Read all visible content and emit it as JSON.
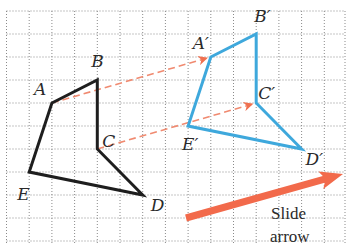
{
  "grid": {
    "x0": 6.5,
    "y0": 11,
    "step_x": 22.7,
    "step_y": 23,
    "cols": 15,
    "rows": 10,
    "color": "#8a8a8a"
  },
  "original": {
    "color": "#1e1e1e",
    "vertices": [
      {
        "label": "A",
        "i": 2,
        "j": 4,
        "lx": -18,
        "ly": -8
      },
      {
        "label": "B",
        "i": 4,
        "j": 3,
        "lx": -6,
        "ly": -13
      },
      {
        "label": "C",
        "i": 4,
        "j": 6,
        "lx": 5,
        "ly": -2
      },
      {
        "label": "D",
        "i": 6,
        "j": 8,
        "lx": 8,
        "ly": 16
      },
      {
        "label": "E",
        "i": 1,
        "j": 7,
        "lx": -12,
        "ly": 28
      }
    ]
  },
  "image": {
    "color": "#3ea8dc",
    "vertices": [
      {
        "label": "A′",
        "i": 9,
        "j": 2,
        "lx": -18,
        "ly": -8
      },
      {
        "label": "B′",
        "i": 11,
        "j": 1,
        "lx": -2,
        "ly": -12
      },
      {
        "label": "C′",
        "i": 11,
        "j": 4,
        "lx": 2,
        "ly": -4
      },
      {
        "label": "D′",
        "i": 13,
        "j": 6,
        "lx": 4,
        "ly": 16
      },
      {
        "label": "E′",
        "i": 8,
        "j": 5,
        "lx": -6,
        "ly": 24
      }
    ]
  },
  "vector_arrows": {
    "color": "#f08a70",
    "pairs": [
      [
        "A",
        "A′"
      ],
      [
        "C",
        "C′"
      ]
    ]
  },
  "slide_arrow": {
    "color": "#f26a4b",
    "x1": 186,
    "y1": 218,
    "x2": 343,
    "y2": 174,
    "caption_line1": "Slide",
    "caption_line2": "arrow"
  }
}
